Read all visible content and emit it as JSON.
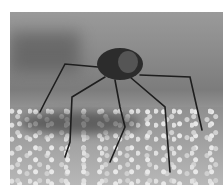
{
  "image": {
    "subject": "long-legged beetle standing on sand",
    "style": "grayscale photograph",
    "colors": {
      "background": "#ffffff",
      "sand": "#a8a8a8",
      "beetle": "#2a2a2a"
    }
  }
}
